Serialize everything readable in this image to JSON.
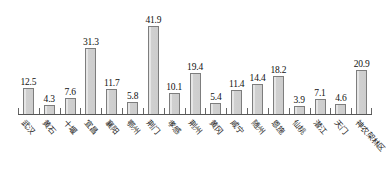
{
  "chart_data": {
    "type": "bar",
    "title": "",
    "subtitle": "",
    "xlabel": "",
    "ylabel": "",
    "ylim": [
      0,
      45
    ],
    "grid": false,
    "legend": null,
    "data_labels": true,
    "categories": [
      "武汉",
      "黄石",
      "十堰",
      "宜昌",
      "襄阳",
      "鄂州",
      "荆门",
      "孝感",
      "荆州",
      "黄冈",
      "咸宁",
      "随州",
      "恩施",
      "仙桃",
      "潜江",
      "天门",
      "神农架林区"
    ],
    "values": [
      12.5,
      4.3,
      7.6,
      31.3,
      11.7,
      5.8,
      41.9,
      10.1,
      19.4,
      5.4,
      11.4,
      14.4,
      18.2,
      3.9,
      7.1,
      4.6,
      20.9
    ],
    "value_labels": [
      "12.5",
      "4.3",
      "7.6",
      "31.3",
      "11.7",
      "5.8",
      "41.9",
      "10.1",
      "19.4",
      "5.4",
      "11.4",
      "14.4",
      "18.2",
      "3.9",
      "7.1",
      "4.6",
      "20.9"
    ]
  },
  "style": {
    "bar_fill": "#d0d0d0",
    "bar_border": "#7d7d7d",
    "axis_color": "#555555",
    "text_color": "#111111",
    "background": "#ffffff"
  }
}
